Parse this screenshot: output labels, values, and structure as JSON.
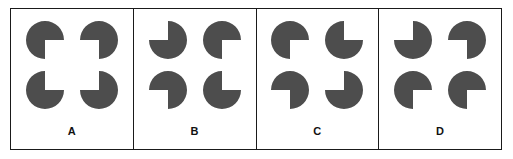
{
  "figure": {
    "background_color": "#ffffff",
    "border_color": "#1a1a1a",
    "shape_color": "#4d4d4d",
    "panel_count": 4
  },
  "panels": [
    {
      "label": "A",
      "shapes": [
        {
          "name": "pacman-top-left",
          "position": "top-left",
          "wedge_direction": "bottom-right",
          "wedge_start_deg": 0,
          "wedge_sweep_deg": 90
        },
        {
          "name": "pacman-top-right",
          "position": "top-right",
          "wedge_direction": "bottom-left",
          "wedge_start_deg": 90,
          "wedge_sweep_deg": 90
        },
        {
          "name": "pacman-bottom-left",
          "position": "bottom-left",
          "wedge_direction": "top-right",
          "wedge_start_deg": 270,
          "wedge_sweep_deg": 90
        },
        {
          "name": "pacman-bottom-right",
          "position": "bottom-right",
          "wedge_direction": "top-left",
          "wedge_start_deg": 180,
          "wedge_sweep_deg": 90
        }
      ]
    },
    {
      "label": "B",
      "shapes": [
        {
          "name": "pacman-top-left",
          "position": "top-left",
          "wedge_direction": "top-left",
          "wedge_start_deg": 180,
          "wedge_sweep_deg": 90
        },
        {
          "name": "pacman-top-right",
          "position": "top-right",
          "wedge_direction": "bottom-right",
          "wedge_start_deg": 0,
          "wedge_sweep_deg": 90
        },
        {
          "name": "pacman-bottom-left",
          "position": "bottom-left",
          "wedge_direction": "bottom-left",
          "wedge_start_deg": 90,
          "wedge_sweep_deg": 90
        },
        {
          "name": "pacman-bottom-right",
          "position": "bottom-right",
          "wedge_direction": "top-right",
          "wedge_start_deg": 270,
          "wedge_sweep_deg": 90
        }
      ]
    },
    {
      "label": "C",
      "shapes": [
        {
          "name": "pacman-top-left",
          "position": "top-left",
          "wedge_direction": "bottom-right",
          "wedge_start_deg": 0,
          "wedge_sweep_deg": 90
        },
        {
          "name": "pacman-top-right",
          "position": "top-right",
          "wedge_direction": "top-right",
          "wedge_start_deg": 270,
          "wedge_sweep_deg": 90
        },
        {
          "name": "pacman-bottom-left",
          "position": "bottom-left",
          "wedge_direction": "bottom-left",
          "wedge_start_deg": 90,
          "wedge_sweep_deg": 90
        },
        {
          "name": "pacman-bottom-right",
          "position": "bottom-right",
          "wedge_direction": "top-left",
          "wedge_start_deg": 180,
          "wedge_sweep_deg": 90
        }
      ]
    },
    {
      "label": "D",
      "shapes": [
        {
          "name": "pacman-top-left",
          "position": "top-left",
          "wedge_direction": "top-left",
          "wedge_start_deg": 180,
          "wedge_sweep_deg": 90
        },
        {
          "name": "pacman-top-right",
          "position": "top-right",
          "wedge_direction": "bottom-left",
          "wedge_start_deg": 90,
          "wedge_sweep_deg": 90
        },
        {
          "name": "pacman-bottom-left",
          "position": "bottom-left",
          "wedge_direction": "bottom-right",
          "wedge_start_deg": 0,
          "wedge_sweep_deg": 90
        },
        {
          "name": "pacman-bottom-right",
          "position": "bottom-right",
          "wedge_direction": "bottom-right",
          "wedge_start_deg": 0,
          "wedge_sweep_deg": 90
        }
      ]
    }
  ]
}
